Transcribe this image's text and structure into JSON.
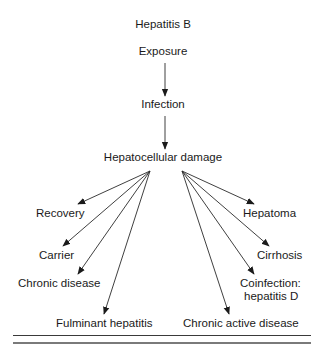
{
  "diagram": {
    "title": "Hepatitis B",
    "nodes": {
      "exposure": "Exposure",
      "infection": "Infection",
      "damage": "Hepatocellular damage",
      "recovery": "Recovery",
      "carrier": "Carrier",
      "chronic_disease": "Chronic disease",
      "fulminant": "Fulminant hepatitis",
      "hepatoma": "Hepatoma",
      "cirrhosis": "Cirrhosis",
      "coinfection_line1": "Coinfection:",
      "coinfection_line2": "hepatitis D",
      "chronic_active": "Chronic active disease"
    },
    "edges": [
      {
        "from": "Exposure",
        "to": "Infection"
      },
      {
        "from": "Infection",
        "to": "Hepatocellular damage"
      },
      {
        "from": "Hepatocellular damage",
        "to": "Recovery"
      },
      {
        "from": "Hepatocellular damage",
        "to": "Carrier"
      },
      {
        "from": "Hepatocellular damage",
        "to": "Chronic disease"
      },
      {
        "from": "Hepatocellular damage",
        "to": "Fulminant hepatitis"
      },
      {
        "from": "Hepatocellular damage",
        "to": "Hepatoma"
      },
      {
        "from": "Hepatocellular damage",
        "to": "Cirrhosis"
      },
      {
        "from": "Hepatocellular damage",
        "to": "Coinfection: hepatitis D"
      },
      {
        "from": "Hepatocellular damage",
        "to": "Chronic active disease"
      }
    ],
    "colors": {
      "ink": "#1a1a1a",
      "rule_light": "#7a7a7a"
    }
  }
}
